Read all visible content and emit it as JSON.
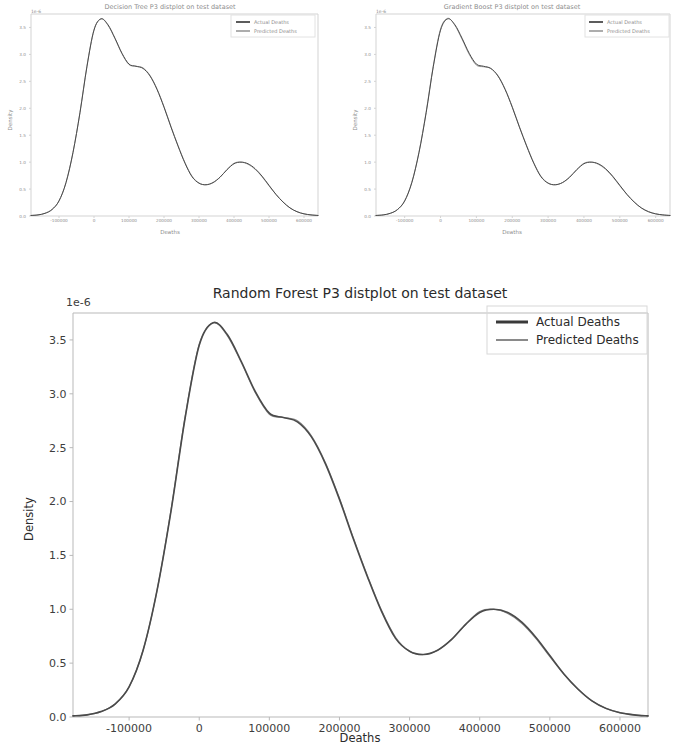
{
  "page": {
    "background_color": "#ffffff",
    "width": 674,
    "height": 752
  },
  "style": {
    "actual_color": "#4a4a4a",
    "predicted_color": "#8a8a8a",
    "axis_color": "#b9b9b9",
    "text_color": "#2b2b2b",
    "thumb_text_color": "#8d8d8d"
  },
  "figures": [
    {
      "id": "decision-tree",
      "title": "Decision Tree P3 distplot on test dataset",
      "xlabel": "Deaths",
      "ylabel": "Density",
      "offset_text": "1e-6",
      "legend": [
        "Actual Deaths",
        "Predicted Deaths"
      ]
    },
    {
      "id": "gradient-boost",
      "title": "Gradient Boost P3 distplot on test dataset",
      "xlabel": "Deaths",
      "ylabel": "Density",
      "offset_text": "1e-6",
      "legend": [
        "Actual Deaths",
        "Predicted Deaths"
      ]
    },
    {
      "id": "random-forest",
      "title": "Random Forest P3 distplot on test dataset",
      "xlabel": "Deaths",
      "ylabel": "Density",
      "offset_text": "1e-6",
      "legend": [
        "Actual Deaths",
        "Predicted Deaths"
      ]
    }
  ],
  "chart_data": [
    {
      "id": "decision-tree",
      "type": "line",
      "title": "Decision Tree P3 distplot on test dataset",
      "xlabel": "Deaths",
      "ylabel": "Density",
      "y_offset_exponent": "1e-6",
      "xlim": [
        -180000,
        640000
      ],
      "ylim": [
        0.0,
        3.75
      ],
      "xticks": [
        -100000,
        0,
        100000,
        200000,
        300000,
        400000,
        500000,
        600000
      ],
      "xticklabels": [
        "-100000",
        "0",
        "100000",
        "200000",
        "300000",
        "400000",
        "500000",
        "600000"
      ],
      "yticks": [
        0.0,
        0.5,
        1.0,
        1.5,
        2.0,
        2.5,
        3.0,
        3.5
      ],
      "yticklabels": [
        "0.0",
        "0.5",
        "1.0",
        "1.5",
        "2.0",
        "2.5",
        "3.0",
        "3.5"
      ],
      "grid": false,
      "legend_position": "upper right",
      "series": [
        {
          "name": "Actual Deaths",
          "color": "#4a4a4a",
          "x": [
            -180000,
            -160000,
            -140000,
            -120000,
            -100000,
            -80000,
            -60000,
            -40000,
            -20000,
            0,
            20000,
            40000,
            60000,
            80000,
            100000,
            120000,
            140000,
            160000,
            180000,
            200000,
            220000,
            240000,
            260000,
            280000,
            300000,
            320000,
            340000,
            360000,
            380000,
            400000,
            420000,
            440000,
            460000,
            480000,
            500000,
            520000,
            540000,
            560000,
            580000,
            600000,
            620000,
            640000
          ],
          "y": [
            0.01,
            0.02,
            0.05,
            0.12,
            0.28,
            0.62,
            1.18,
            1.92,
            2.78,
            3.45,
            3.66,
            3.55,
            3.3,
            3.02,
            2.82,
            2.78,
            2.74,
            2.6,
            2.35,
            2.02,
            1.65,
            1.3,
            0.98,
            0.73,
            0.61,
            0.58,
            0.62,
            0.72,
            0.86,
            0.97,
            1.0,
            0.97,
            0.88,
            0.74,
            0.57,
            0.4,
            0.26,
            0.15,
            0.08,
            0.04,
            0.02,
            0.01
          ]
        },
        {
          "name": "Predicted Deaths",
          "color": "#8a8a8a",
          "x": [
            -180000,
            -160000,
            -140000,
            -120000,
            -100000,
            -80000,
            -60000,
            -40000,
            -20000,
            0,
            20000,
            40000,
            60000,
            80000,
            100000,
            120000,
            140000,
            160000,
            180000,
            200000,
            220000,
            240000,
            260000,
            280000,
            300000,
            320000,
            340000,
            360000,
            380000,
            400000,
            420000,
            440000,
            460000,
            480000,
            500000,
            520000,
            540000,
            560000,
            580000,
            600000,
            620000,
            640000
          ],
          "y": [
            0.01,
            0.02,
            0.05,
            0.12,
            0.28,
            0.62,
            1.18,
            1.93,
            2.79,
            3.46,
            3.66,
            3.54,
            3.29,
            3.01,
            2.81,
            2.78,
            2.75,
            2.61,
            2.36,
            2.03,
            1.66,
            1.31,
            0.99,
            0.74,
            0.61,
            0.58,
            0.62,
            0.72,
            0.86,
            0.98,
            1.0,
            0.96,
            0.87,
            0.73,
            0.56,
            0.4,
            0.26,
            0.15,
            0.08,
            0.04,
            0.02,
            0.01
          ]
        }
      ]
    },
    {
      "id": "gradient-boost",
      "type": "line",
      "title": "Gradient Boost P3 distplot on test dataset",
      "xlabel": "Deaths",
      "ylabel": "Density",
      "y_offset_exponent": "1e-6",
      "xlim": [
        -180000,
        640000
      ],
      "ylim": [
        0.0,
        3.75
      ],
      "xticks": [
        -100000,
        0,
        100000,
        200000,
        300000,
        400000,
        500000,
        600000
      ],
      "xticklabels": [
        "-100000",
        "0",
        "100000",
        "200000",
        "300000",
        "400000",
        "500000",
        "600000"
      ],
      "yticks": [
        0.0,
        0.5,
        1.0,
        1.5,
        2.0,
        2.5,
        3.0,
        3.5
      ],
      "yticklabels": [
        "0.0",
        "0.5",
        "1.0",
        "1.5",
        "2.0",
        "2.5",
        "3.0",
        "3.5"
      ],
      "grid": false,
      "legend_position": "upper right",
      "series": [
        {
          "name": "Actual Deaths",
          "color": "#4a4a4a",
          "x": [
            -180000,
            -160000,
            -140000,
            -120000,
            -100000,
            -80000,
            -60000,
            -40000,
            -20000,
            0,
            20000,
            40000,
            60000,
            80000,
            100000,
            120000,
            140000,
            160000,
            180000,
            200000,
            220000,
            240000,
            260000,
            280000,
            300000,
            320000,
            340000,
            360000,
            380000,
            400000,
            420000,
            440000,
            460000,
            480000,
            500000,
            520000,
            540000,
            560000,
            580000,
            600000,
            620000,
            640000
          ],
          "y": [
            0.01,
            0.02,
            0.05,
            0.12,
            0.28,
            0.62,
            1.18,
            1.92,
            2.78,
            3.45,
            3.66,
            3.55,
            3.3,
            3.02,
            2.82,
            2.78,
            2.74,
            2.6,
            2.35,
            2.02,
            1.65,
            1.3,
            0.98,
            0.73,
            0.61,
            0.58,
            0.62,
            0.72,
            0.86,
            0.97,
            1.0,
            0.97,
            0.88,
            0.74,
            0.57,
            0.4,
            0.26,
            0.15,
            0.08,
            0.04,
            0.02,
            0.01
          ]
        },
        {
          "name": "Predicted Deaths",
          "color": "#8a8a8a",
          "x": [
            -180000,
            -160000,
            -140000,
            -120000,
            -100000,
            -80000,
            -60000,
            -40000,
            -20000,
            0,
            20000,
            40000,
            60000,
            80000,
            100000,
            120000,
            140000,
            160000,
            180000,
            200000,
            220000,
            240000,
            260000,
            280000,
            300000,
            320000,
            340000,
            360000,
            380000,
            400000,
            420000,
            440000,
            460000,
            480000,
            500000,
            520000,
            540000,
            560000,
            580000,
            600000,
            620000,
            640000
          ],
          "y": [
            0.01,
            0.02,
            0.05,
            0.12,
            0.28,
            0.63,
            1.19,
            1.94,
            2.8,
            3.47,
            3.67,
            3.54,
            3.28,
            3.0,
            2.8,
            2.77,
            2.74,
            2.61,
            2.36,
            2.03,
            1.66,
            1.31,
            0.99,
            0.74,
            0.61,
            0.58,
            0.62,
            0.72,
            0.86,
            0.98,
            1.0,
            0.96,
            0.87,
            0.73,
            0.56,
            0.4,
            0.26,
            0.15,
            0.08,
            0.04,
            0.02,
            0.01
          ]
        }
      ]
    },
    {
      "id": "random-forest",
      "type": "line",
      "title": "Random Forest P3 distplot on test dataset",
      "xlabel": "Deaths",
      "ylabel": "Density",
      "y_offset_exponent": "1e-6",
      "xlim": [
        -180000,
        640000
      ],
      "ylim": [
        0.0,
        3.75
      ],
      "xticks": [
        -100000,
        0,
        100000,
        200000,
        300000,
        400000,
        500000,
        600000
      ],
      "xticklabels": [
        "-100000",
        "0",
        "100000",
        "200000",
        "300000",
        "400000",
        "500000",
        "600000"
      ],
      "yticks": [
        0.0,
        0.5,
        1.0,
        1.5,
        2.0,
        2.5,
        3.0,
        3.5
      ],
      "yticklabels": [
        "0.0",
        "0.5",
        "1.0",
        "1.5",
        "2.0",
        "2.5",
        "3.0",
        "3.5"
      ],
      "grid": false,
      "legend_position": "upper right",
      "series": [
        {
          "name": "Actual Deaths",
          "color": "#4a4a4a",
          "x": [
            -180000,
            -160000,
            -140000,
            -120000,
            -100000,
            -80000,
            -60000,
            -40000,
            -20000,
            0,
            20000,
            40000,
            60000,
            80000,
            100000,
            120000,
            140000,
            160000,
            180000,
            200000,
            220000,
            240000,
            260000,
            280000,
            300000,
            320000,
            340000,
            360000,
            380000,
            400000,
            420000,
            440000,
            460000,
            480000,
            500000,
            520000,
            540000,
            560000,
            580000,
            600000,
            620000,
            640000
          ],
          "y": [
            0.01,
            0.02,
            0.05,
            0.12,
            0.28,
            0.62,
            1.18,
            1.92,
            2.78,
            3.45,
            3.66,
            3.55,
            3.3,
            3.02,
            2.82,
            2.78,
            2.74,
            2.6,
            2.35,
            2.02,
            1.65,
            1.3,
            0.98,
            0.73,
            0.61,
            0.58,
            0.62,
            0.72,
            0.86,
            0.97,
            1.0,
            0.97,
            0.88,
            0.74,
            0.57,
            0.4,
            0.26,
            0.15,
            0.08,
            0.04,
            0.02,
            0.01
          ]
        },
        {
          "name": "Predicted Deaths",
          "color": "#8a8a8a",
          "x": [
            -180000,
            -160000,
            -140000,
            -120000,
            -100000,
            -80000,
            -60000,
            -40000,
            -20000,
            0,
            20000,
            40000,
            60000,
            80000,
            100000,
            120000,
            140000,
            160000,
            180000,
            200000,
            220000,
            240000,
            260000,
            280000,
            300000,
            320000,
            340000,
            360000,
            380000,
            400000,
            420000,
            440000,
            460000,
            480000,
            500000,
            520000,
            540000,
            560000,
            580000,
            600000,
            620000,
            640000
          ],
          "y": [
            0.01,
            0.02,
            0.05,
            0.12,
            0.28,
            0.62,
            1.18,
            1.93,
            2.79,
            3.46,
            3.66,
            3.54,
            3.29,
            3.01,
            2.81,
            2.78,
            2.75,
            2.61,
            2.36,
            2.03,
            1.66,
            1.31,
            0.99,
            0.74,
            0.61,
            0.58,
            0.62,
            0.72,
            0.86,
            0.98,
            1.0,
            0.96,
            0.87,
            0.73,
            0.56,
            0.4,
            0.26,
            0.15,
            0.08,
            0.04,
            0.02,
            0.01
          ]
        }
      ]
    }
  ]
}
